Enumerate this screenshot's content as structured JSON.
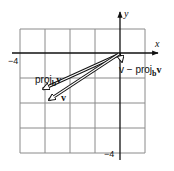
{
  "diagram": {
    "type": "vector-projection",
    "grid": {
      "xmin": -4,
      "xmax": 1,
      "ymin": -4,
      "ymax": 1,
      "step": 1
    },
    "axes": {
      "x_label": "x",
      "y_label": "y",
      "x_tick_label": "−4",
      "y_tick_label": "−4"
    },
    "vectors": [
      {
        "name": "v",
        "label": "v",
        "from": [
          0,
          0
        ],
        "to": [
          -3,
          -2
        ]
      },
      {
        "name": "proj",
        "label_prefix": "proj",
        "label_sub": "b",
        "label_suffix": "v",
        "from": [
          0,
          0
        ],
        "to": [
          -3.1,
          -1.45
        ]
      },
      {
        "name": "perp",
        "label_prefix": "v − proj",
        "label_sub": "b",
        "label_suffix": "v",
        "from": [
          0,
          0
        ],
        "to": [
          0.1,
          -0.45
        ]
      }
    ],
    "colors": {
      "line": "#111111",
      "grid": "#8a8a8a",
      "background": "#ffffff"
    }
  }
}
